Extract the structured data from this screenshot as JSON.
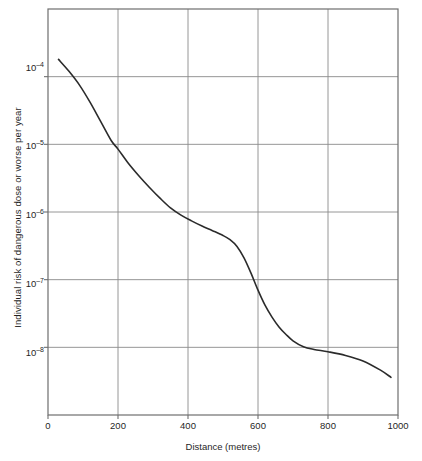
{
  "chart_data": {
    "type": "line",
    "title": "",
    "subtitle": "",
    "xlabel": "Distance (metres)",
    "ylabel": "Individual risk of dangerous dose or worse per year",
    "xlim": [
      0,
      1000
    ],
    "ylim": [
      1e-09,
      0.001
    ],
    "yscale": "log",
    "xscale": "linear",
    "grid": true,
    "legend": null,
    "legend_position": "none",
    "xticks": [
      {
        "value": 0,
        "label": "0"
      },
      {
        "value": 200,
        "label": "200"
      },
      {
        "value": 400,
        "label": "400"
      },
      {
        "value": 600,
        "label": "600"
      },
      {
        "value": 800,
        "label": "800"
      },
      {
        "value": 1000,
        "label": "1000"
      }
    ],
    "yticks": [
      {
        "value": 0.0001,
        "mantissa": "10",
        "exponent": "–4"
      },
      {
        "value": 1e-05,
        "mantissa": "10",
        "exponent": "–5"
      },
      {
        "value": 1e-06,
        "mantissa": "10",
        "exponent": "–6"
      },
      {
        "value": 1e-07,
        "mantissa": "10",
        "exponent": "–7"
      },
      {
        "value": 1e-08,
        "mantissa": "10",
        "exponent": "–8"
      }
    ],
    "series": [
      {
        "name": "Individual risk of dangerous dose or worse per year",
        "color": "#2b2b2b",
        "linewidth": 1.6,
        "x": [
          30,
          60,
          90,
          120,
          150,
          180,
          200,
          230,
          260,
          290,
          320,
          350,
          380,
          410,
          440,
          470,
          500,
          520,
          540,
          560,
          580,
          600,
          620,
          640,
          660,
          680,
          700,
          730,
          760,
          800,
          850,
          900,
          950,
          980
        ],
        "y": [
          0.00018,
          0.00012,
          7.5e-05,
          4.2e-05,
          2.2e-05,
          1.15e-05,
          8.5e-06,
          5.2e-06,
          3.4e-06,
          2.3e-06,
          1.6e-06,
          1.15e-06,
          9e-07,
          7.4e-07,
          6.2e-07,
          5.3e-07,
          4.5e-07,
          3.9e-07,
          3.1e-07,
          2.1e-07,
          1.25e-07,
          7e-08,
          4.2e-08,
          2.8e-08,
          2e-08,
          1.55e-08,
          1.25e-08,
          1.02e-08,
          9.3e-09,
          8.6e-09,
          7.6e-09,
          6.3e-09,
          4.6e-09,
          3.6e-09
        ]
      }
    ],
    "annotations": []
  },
  "axis": {
    "frame_color": "#6e6e6e",
    "grid_color": "#8a8a8a",
    "background": "#ffffff"
  }
}
